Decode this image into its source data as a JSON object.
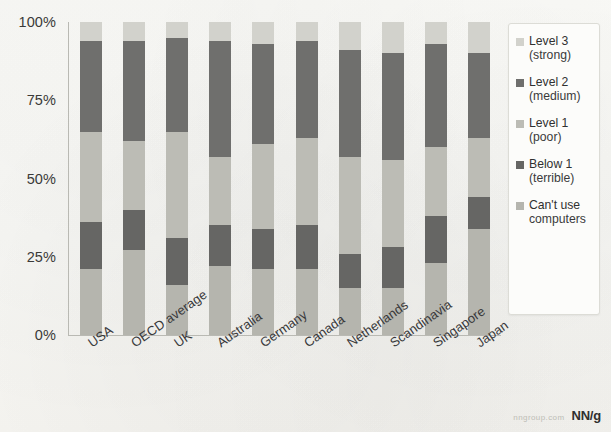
{
  "chart_data": {
    "type": "bar",
    "subtype": "stacked-percentage",
    "title": "",
    "xlabel": "",
    "ylabel": "",
    "ylim": [
      0,
      100
    ],
    "ytick_labels": [
      "100%",
      "75%",
      "50%",
      "25%",
      "0%"
    ],
    "ytick_values": [
      100,
      75,
      50,
      25,
      0
    ],
    "grid": false,
    "legend_position": "right",
    "categories": [
      "USA",
      "OECD average",
      "UK",
      "Australia",
      "Germany",
      "Canada",
      "Netherlands",
      "Scandinavia",
      "Singapore",
      "Japan"
    ],
    "series": [
      {
        "name": "Level 3 (strong)",
        "color": "#d2d2cc",
        "values": [
          6,
          6,
          5,
          6,
          7,
          6,
          9,
          10,
          7,
          10
        ]
      },
      {
        "name": "Level 2 (medium)",
        "color": "#6f6f6d",
        "values": [
          29,
          32,
          30,
          37,
          32,
          31,
          34,
          34,
          33,
          27
        ]
      },
      {
        "name": "Level 1 (poor)",
        "color": "#bcbcb5",
        "values": [
          29,
          22,
          34,
          22,
          27,
          28,
          31,
          28,
          22,
          19
        ]
      },
      {
        "name": "Below 1 (terrible)",
        "color": "#666664",
        "values": [
          15,
          13,
          15,
          13,
          13,
          14,
          11,
          13,
          15,
          10
        ]
      },
      {
        "name": "Can't use computers",
        "color": "#b5b5ae",
        "values": [
          21,
          27,
          16,
          22,
          21,
          21,
          15,
          15,
          23,
          34
        ]
      }
    ]
  },
  "legend": {
    "items": [
      {
        "label": "Level 3",
        "sub": "(strong)",
        "color": "#d2d2cc"
      },
      {
        "label": "Level 2",
        "sub": "(medium)",
        "color": "#6f6f6d"
      },
      {
        "label": "Level 1",
        "sub": "(poor)",
        "color": "#bcbcb5"
      },
      {
        "label": "Below 1",
        "sub": "(terrible)",
        "color": "#666664"
      },
      {
        "label": "Can't use",
        "sub": "computers",
        "color": "#b5b5ae"
      }
    ]
  },
  "watermark": {
    "url": "nngroup.com",
    "logo": "NN/g"
  }
}
